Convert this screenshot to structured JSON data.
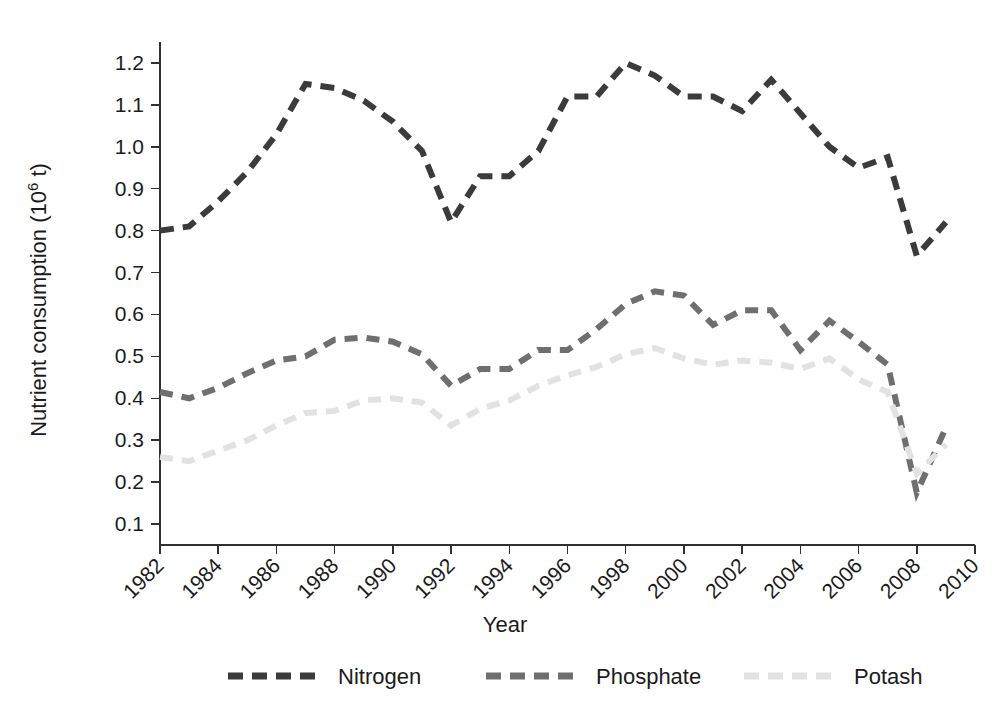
{
  "chart_data": {
    "type": "line",
    "title": "",
    "xlabel": "Year",
    "ylabel": "Nutrient consumption (10^6 t)",
    "ylabel_display": "Nutrient consumption (10",
    "ylabel_exponent": "^6",
    "ylabel_suffix": " t)",
    "grid": false,
    "legend_position": "bottom",
    "xlim": [
      1982,
      2010
    ],
    "ylim": [
      0.05,
      1.25
    ],
    "x": [
      1982,
      1983,
      1984,
      1985,
      1986,
      1987,
      1988,
      1989,
      1990,
      1991,
      1992,
      1993,
      1994,
      1995,
      1996,
      1997,
      1998,
      1999,
      2000,
      2001,
      2002,
      2003,
      2004,
      2005,
      2006,
      2007,
      2008,
      2009
    ],
    "xticks": [
      1982,
      1984,
      1986,
      1988,
      1990,
      1992,
      1994,
      1996,
      1998,
      2000,
      2002,
      2004,
      2006,
      2008,
      2010
    ],
    "xtick_labels": [
      "1982",
      "1984",
      "1986",
      "1988",
      "1990",
      "1992",
      "1994",
      "1996",
      "1998",
      "2000",
      "2002",
      "2004",
      "2006",
      "2008",
      "2010"
    ],
    "yticks": [
      0.1,
      0.2,
      0.3,
      0.4,
      0.5,
      0.6,
      0.7,
      0.8,
      0.9,
      1.0,
      1.1,
      1.2
    ],
    "ytick_labels": [
      "0.1",
      "0.2",
      "0.3",
      "0.4",
      "0.5",
      "0.6",
      "0.7",
      "0.8",
      "0.9",
      "1.0",
      "1.1",
      "1.2"
    ],
    "series": [
      {
        "name": "Nitrogen",
        "color": "#3b3b3b",
        "dash": "14,9",
        "width": 6,
        "values": [
          0.8,
          0.81,
          0.87,
          0.94,
          1.03,
          1.15,
          1.14,
          1.11,
          1.06,
          0.99,
          0.82,
          0.93,
          0.93,
          0.99,
          1.12,
          1.12,
          1.2,
          1.17,
          1.12,
          1.12,
          1.085,
          1.16,
          1.08,
          1.0,
          0.95,
          0.975,
          0.74,
          0.82
        ]
      },
      {
        "name": "Phosphate",
        "color": "#6f6f6f",
        "dash": "13,9",
        "width": 6,
        "values": [
          0.415,
          0.4,
          0.425,
          0.46,
          0.49,
          0.5,
          0.54,
          0.545,
          0.535,
          0.505,
          0.43,
          0.47,
          0.47,
          0.515,
          0.515,
          0.565,
          0.625,
          0.655,
          0.645,
          0.575,
          0.61,
          0.61,
          0.515,
          0.585,
          0.535,
          0.48,
          0.175,
          0.33
        ]
      },
      {
        "name": "Potash",
        "color": "#e2e2e2",
        "dash": "13,9",
        "width": 6,
        "values": [
          0.26,
          0.25,
          0.275,
          0.3,
          0.335,
          0.365,
          0.37,
          0.395,
          0.4,
          0.39,
          0.335,
          0.375,
          0.395,
          0.43,
          0.455,
          0.475,
          0.505,
          0.52,
          0.495,
          0.48,
          0.49,
          0.485,
          0.47,
          0.495,
          0.445,
          0.415,
          0.22,
          0.29
        ]
      }
    ],
    "legend": [
      {
        "label": "Nitrogen",
        "color": "#3b3b3b"
      },
      {
        "label": "Phosphate",
        "color": "#6f6f6f"
      },
      {
        "label": "Potash",
        "color": "#e2e2e2"
      }
    ]
  }
}
